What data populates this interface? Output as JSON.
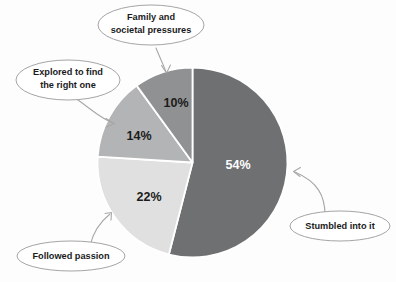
{
  "chart_data": {
    "type": "pie",
    "title": "",
    "subtitle": "",
    "xlabel": "",
    "ylabel": "",
    "legend_position": "callout-labels",
    "grid": false,
    "units": "percent",
    "total": 100,
    "categories": [
      "Stumbled into it",
      "Followed passion",
      "Explored to find the right one",
      "Family and societal pressures"
    ],
    "values": [
      54,
      22,
      14,
      10
    ],
    "value_labels": [
      "54%",
      "22%",
      "14%",
      "10%"
    ],
    "colors": [
      "#6f7072",
      "#e0e0e0",
      "#b3b4b5",
      "#909192"
    ],
    "label_text_colors": [
      "#ffffff",
      "#1b1b1b",
      "#1b1b1b",
      "#1b1b1b"
    ],
    "slices": [
      {
        "name": "Stumbled into it",
        "value": 54,
        "value_label": "54%",
        "color": "#6f7072",
        "start_angle_deg": 0,
        "end_angle_deg": 194.4,
        "callout_position": "right"
      },
      {
        "name": "Followed passion",
        "value": 22,
        "value_label": "22%",
        "color": "#e0e0e0",
        "start_angle_deg": 194.4,
        "end_angle_deg": 273.6,
        "callout_position": "bottom-left"
      },
      {
        "name": "Explored to find the right one",
        "value": 14,
        "value_label": "14%",
        "color": "#b3b4b5",
        "start_angle_deg": 273.6,
        "end_angle_deg": 324.0,
        "callout_position": "left"
      },
      {
        "name": "Family and societal pressures",
        "value": 10,
        "value_label": "10%",
        "color": "#909192",
        "start_angle_deg": 324.0,
        "end_angle_deg": 360.0,
        "callout_position": "top"
      }
    ]
  },
  "callouts": {
    "family": {
      "line1": "Family and",
      "line2": "societal pressures"
    },
    "explored": {
      "line1": "Explored to find",
      "line2": "the right one"
    },
    "followed": {
      "line1": "Followed passion",
      "line2": ""
    },
    "stumbled": {
      "line1": "Stumbled into it",
      "line2": ""
    }
  },
  "slice_labels": {
    "stumbled_pct": "54%",
    "followed_pct": "22%",
    "explored_pct": "14%",
    "family_pct": "10%"
  },
  "style": {
    "background": "#fdfdfd",
    "bubble_stroke": "#9a9a9a",
    "connector_stroke": "#a8a8a8",
    "slice_divider": "#ffffff"
  }
}
